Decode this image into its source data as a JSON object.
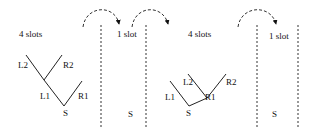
{
  "diagram": {
    "panels": [
      {
        "kind": "tree",
        "slots_label": "4 slots",
        "nodes": {
          "L2": "L2",
          "R2": "R2",
          "L1": "L1",
          "R1": "R1",
          "S": "S"
        }
      },
      {
        "kind": "column",
        "slots_label": "1 slot",
        "bottom": "S"
      },
      {
        "kind": "tree",
        "slots_label": "4 slots",
        "nodes": {
          "L2": "L2",
          "R2": "R2",
          "L1": "L1",
          "R1": "R1",
          "S": "S"
        }
      },
      {
        "kind": "column",
        "slots_label": "1 slot",
        "bottom": "S"
      }
    ],
    "arrows": [
      "transition-1",
      "transition-2",
      "transition-3"
    ],
    "colors": {
      "ink": "#222222",
      "background": "#ffffff"
    }
  }
}
